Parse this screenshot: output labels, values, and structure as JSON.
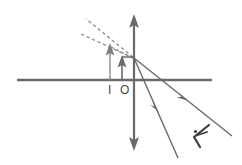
{
  "diagram": {
    "kind": "optics-ray-diagram",
    "background_color": "#ffffff",
    "stroke_color": "#6a6a6a",
    "dash_color": "#8a8a8a",
    "label_color": "#4a4a4a",
    "stroke_width": 1.4,
    "thick_stroke_width": 2.2,
    "canvas": {
      "width": 242,
      "height": 165
    },
    "labels": {
      "image": "I",
      "object": "O"
    },
    "elements": {
      "principal_axis": {
        "name": "horizontal-axis-line",
        "x1": 17,
        "y1": 80,
        "x2": 212,
        "y2": 80
      },
      "mirror": {
        "name": "mirror-vertical-line",
        "x": 134,
        "y1": 16,
        "y2": 149,
        "arrow_top": true,
        "arrow_bottom": true
      },
      "object_arrow": {
        "name": "object-arrow",
        "x": 122,
        "y_base": 80,
        "y_tip": 57
      },
      "image_arrow": {
        "name": "image-arrow-dashed",
        "x": 110,
        "y_base": 80,
        "y_tip": 45,
        "dashed": true
      },
      "ray_upper": {
        "name": "reflected-ray-upper",
        "x1": 134,
        "y1": 58,
        "x2": 232,
        "y2": 136,
        "arrow_at": {
          "x": 183,
          "y": 97
        }
      },
      "ray_lower": {
        "name": "reflected-ray-lower",
        "x1": 134,
        "y1": 58,
        "x2": 178,
        "y2": 158,
        "arrow_at": {
          "x": 156,
          "y": 108
        }
      },
      "virtual_ray_upper": {
        "name": "virtual-ray-upper-dashed",
        "x1": 134,
        "y1": 58,
        "x2": 86,
        "y2": 20,
        "dashed": true
      },
      "virtual_ray_lower": {
        "name": "virtual-ray-lower-dashed",
        "x1": 134,
        "y1": 58,
        "x2": 80,
        "y2": 34,
        "dashed": true
      },
      "incident_ray_construction": {
        "name": "incident-ray-dashed",
        "x1": 110,
        "y1": 45,
        "x2": 134,
        "y2": 58,
        "dashed": true
      },
      "corner_mark": {
        "name": "right-angle-corner-mark",
        "x": 122,
        "y": 57,
        "size": 12
      },
      "eye": {
        "name": "observer-eye-icon",
        "cx": 201,
        "cy": 135
      }
    }
  }
}
